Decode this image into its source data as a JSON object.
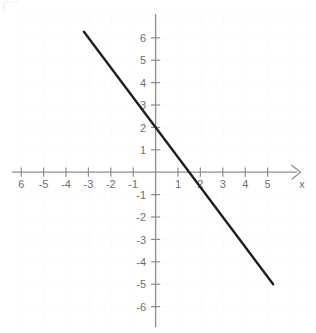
{
  "figure": {
    "kind": "cartesian-coordinate-plane",
    "background_color": "#ffffff",
    "grid_color": "#e9e9ef",
    "axis_color": "#8d8d93",
    "label_color": "#6e6e72",
    "line_color": "#231f20"
  },
  "axes": {
    "x_axis_name": "x",
    "y_axis_name": "",
    "x_tick_labels": [
      "6",
      "-5",
      "-4",
      "-3",
      "-2",
      "-1",
      "1",
      "2",
      "3",
      "4",
      "5"
    ],
    "y_tick_labels": [
      "6",
      "5",
      "4",
      "3",
      "2",
      "1",
      "-1",
      "-2",
      "-3",
      "-4",
      "-5",
      "-6"
    ],
    "x_tick_values": [
      -6,
      -5,
      -4,
      -3,
      -2,
      -1,
      1,
      2,
      3,
      4,
      5
    ],
    "y_tick_values": [
      6,
      5,
      4,
      3,
      2,
      1,
      -1,
      -2,
      -3,
      -4,
      -5,
      -6
    ],
    "has_x_arrow": true,
    "has_y_arrow": false
  },
  "chart_data": {
    "type": "line",
    "title": "",
    "subtitle": "",
    "xlabel": "x",
    "ylabel": "",
    "xlim": [
      -6.4,
      5.6
    ],
    "ylim": [
      -6.6,
      6.6
    ],
    "grid": true,
    "grid_style": "dotted",
    "legend": "none",
    "series": [
      {
        "name": "linear-function",
        "equation": "y = -4/3 x + 2",
        "slope": -1.3333,
        "intercept": 2,
        "x_intercept": 1.5,
        "y_intercept": 2,
        "x": [
          -3.2,
          5.25
        ],
        "y": [
          6.27,
          -5.0
        ],
        "endpoints": [
          [
            -3.2,
            6.27
          ],
          [
            5.25,
            -5.0
          ]
        ],
        "color": "#231f20",
        "width": 2.4
      }
    ],
    "annotations": []
  }
}
